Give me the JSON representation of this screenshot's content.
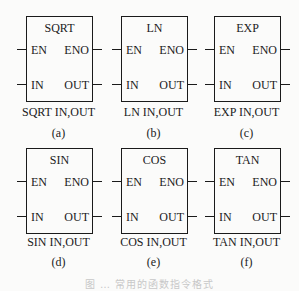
{
  "figure": {
    "caption": "图 … 常用的函数指令格式",
    "blocks": [
      {
        "name": "SQRT",
        "pins_left": [
          "EN",
          "IN"
        ],
        "pins_right": [
          "ENO",
          "OUT"
        ],
        "instruction": "SQRT IN,OUT",
        "label": "(a)"
      },
      {
        "name": "LN",
        "pins_left": [
          "EN",
          "IN"
        ],
        "pins_right": [
          "ENO",
          "OUT"
        ],
        "instruction": "LN IN,OUT",
        "label": "(b)"
      },
      {
        "name": "EXP",
        "pins_left": [
          "EN",
          "IN"
        ],
        "pins_right": [
          "ENO",
          "OUT"
        ],
        "instruction": "EXP IN,OUT",
        "label": "(c)"
      },
      {
        "name": "SIN",
        "pins_left": [
          "EN",
          "IN"
        ],
        "pins_right": [
          "ENO",
          "OUT"
        ],
        "instruction": "SIN IN,OUT",
        "label": "(d)"
      },
      {
        "name": "COS",
        "pins_left": [
          "EN",
          "IN"
        ],
        "pins_right": [
          "ENO",
          "OUT"
        ],
        "instruction": "COS IN,OUT",
        "label": "(e)"
      },
      {
        "name": "TAN",
        "pins_left": [
          "EN",
          "IN"
        ],
        "pins_right": [
          "ENO",
          "OUT"
        ],
        "instruction": "TAN IN,OUT",
        "label": "(f)"
      }
    ]
  }
}
